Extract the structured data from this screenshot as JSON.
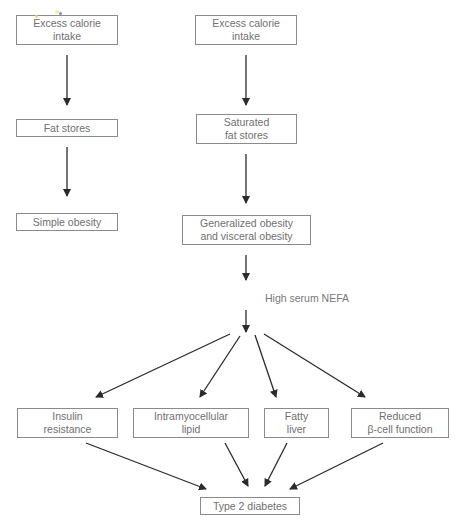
{
  "diagram": {
    "type": "flowchart",
    "left_column": {
      "nodes": [
        {
          "id": "l1",
          "label": "Excess calorie\nintake"
        },
        {
          "id": "l2",
          "label": "Fat stores"
        },
        {
          "id": "l3",
          "label": "Simple obesity"
        }
      ]
    },
    "right_column": {
      "nodes": [
        {
          "id": "r1",
          "label": "Excess calorie\nintake"
        },
        {
          "id": "r2",
          "label": "Saturated\nfat stores"
        },
        {
          "id": "r3",
          "label": "Generalized obesity\nand visceral obesity"
        }
      ],
      "intermediate_label": "High serum NEFA"
    },
    "effects": [
      {
        "id": "e1",
        "label": "Insulin\nresistance"
      },
      {
        "id": "e2",
        "label": "Intramyocellular\nlipid"
      },
      {
        "id": "e3",
        "label": "Fatty\nliver"
      },
      {
        "id": "e4",
        "label": "Reduced\nβ-cell function"
      }
    ],
    "outcome": {
      "id": "o1",
      "label": "Type 2 diabetes"
    },
    "edges": [
      [
        "l1",
        "l2"
      ],
      [
        "l2",
        "l3"
      ],
      [
        "r1",
        "r2"
      ],
      [
        "r2",
        "r3"
      ],
      [
        "r3",
        "nefa"
      ],
      [
        "nefa",
        "e1"
      ],
      [
        "nefa",
        "e2"
      ],
      [
        "nefa",
        "e3"
      ],
      [
        "nefa",
        "e4"
      ],
      [
        "e1",
        "o1"
      ],
      [
        "e2",
        "o1"
      ],
      [
        "e3",
        "o1"
      ],
      [
        "e4",
        "o1"
      ]
    ]
  },
  "colors": {
    "line": "#2b2b2b",
    "box_border": "#8a8a8a",
    "text": "#6f6f6f"
  }
}
